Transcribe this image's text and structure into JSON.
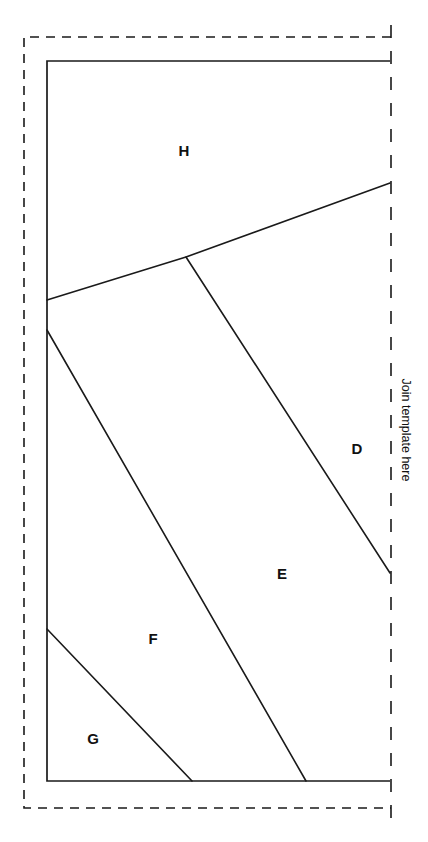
{
  "page": {
    "width": 428,
    "height": 842,
    "background_color": "#ffffff",
    "line_color": "#1a1a1a",
    "text_color": "#111111"
  },
  "annotations": {
    "join_edge_label": "Join template here"
  },
  "regions": [
    {
      "id": "H",
      "label": "H",
      "x": 184,
      "y": 150
    },
    {
      "id": "D",
      "label": "D",
      "x": 357,
      "y": 448
    },
    {
      "id": "E",
      "label": "E",
      "x": 282,
      "y": 573
    },
    {
      "id": "F",
      "label": "F",
      "x": 153,
      "y": 638
    },
    {
      "id": "G",
      "label": "G",
      "x": 93,
      "y": 738
    }
  ],
  "geometry": {
    "cut_border": {
      "name": "dashed-trim-border",
      "style": "dashed",
      "left": 24,
      "top": 37,
      "bottom": 808,
      "right": 391
    },
    "solid_frame": {
      "name": "solid-pattern-frame",
      "left": 47,
      "top": 61,
      "right": 390,
      "bottom": 781
    },
    "divider_lines": [
      {
        "id": "H-D",
        "points": "47,300 186,257 390,183"
      },
      {
        "id": "D-E",
        "points": "186,257 390,573"
      },
      {
        "id": "E-F",
        "points": "47,330 306,781"
      },
      {
        "id": "F-G",
        "points": "47,629 192,781"
      }
    ]
  }
}
